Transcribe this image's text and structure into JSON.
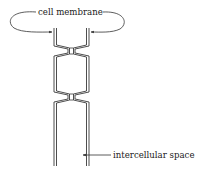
{
  "diagram": {
    "labels": {
      "top": "cell membrane",
      "bottom": "intercellular space"
    },
    "colors": {
      "line": "#3a3a3a",
      "membrane_fill": "#ffffff",
      "text": "#222222",
      "background": "#ffffff"
    },
    "structure": {
      "junction_count": 2,
      "description": "two adjacent cell membranes joined at two tight junction points"
    }
  }
}
